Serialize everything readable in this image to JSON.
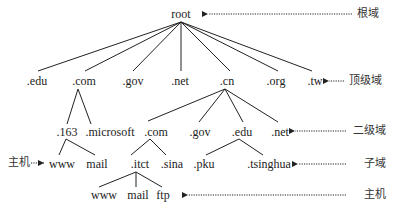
{
  "diagram": {
    "root": {
      "label": "root"
    },
    "top_level": [
      ".edu",
      ".com",
      ".gov",
      ".net",
      ".cn",
      ".org",
      ".tw"
    ],
    "second_level": {
      "com_children": [
        ".163",
        ".microsoft"
      ],
      "cn_children": [
        ".com",
        ".gov",
        ".edu",
        ".net"
      ]
    },
    "third_level": {
      "163_children": [
        "www",
        "mail"
      ],
      "cn_com_children": [
        ".itct",
        ".sina"
      ],
      "cn_edu_children": [
        ".pku",
        ".tsinghua"
      ]
    },
    "fourth_level": {
      "itct_children": [
        "www",
        "mail",
        "ftp"
      ]
    },
    "annotations": {
      "root_domain": "根域",
      "top_level_domain": "顶级域",
      "second_level_domain": "二级域",
      "subdomain": "子域",
      "host_right": "主机",
      "host_left": "主机"
    },
    "colors": {
      "line": "#222222",
      "text": "#222222",
      "arrow": "#222222"
    }
  }
}
